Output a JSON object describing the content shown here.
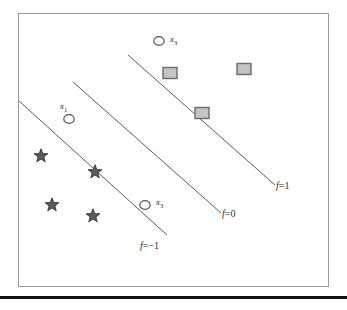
{
  "figure": {
    "kind": "scatter-with-decision-boundaries",
    "frame": {
      "x": 18,
      "y": 13,
      "width": 311,
      "height": 274,
      "border_color": "#9a9a9a"
    },
    "background": "#ffffff",
    "bottom_rule_color": "#111111"
  },
  "chart_data": {
    "type": "scatter",
    "title": "",
    "xlabel": "",
    "ylabel": "",
    "xlim": [
      0,
      347
    ],
    "ylim": [
      0,
      310
    ],
    "grid": false,
    "legend": "none",
    "axes_visible": false,
    "series": [
      {
        "name": "squares",
        "marker": "square",
        "fill_color": "#c4c4c4",
        "edge_color": "#6b6b6b",
        "points": [
          {
            "x": 170,
            "y": 73
          },
          {
            "x": 202,
            "y": 113
          },
          {
            "x": 244,
            "y": 69
          }
        ]
      },
      {
        "name": "circles",
        "marker": "circle-open",
        "fill_color": "#ffffff",
        "edge_color": "#555555",
        "points": [
          {
            "x": 159,
            "y": 41,
            "label": "x",
            "sub": "3"
          },
          {
            "x": 69,
            "y": 119,
            "label": "x",
            "sub": "1"
          },
          {
            "x": 145,
            "y": 205,
            "label": "x",
            "sub": "3"
          }
        ]
      },
      {
        "name": "stars",
        "marker": "star",
        "fill_color": "#5a5a60",
        "edge_color": "#3d3d44",
        "points": [
          {
            "x": 41,
            "y": 156
          },
          {
            "x": 95,
            "y": 172
          },
          {
            "x": 52,
            "y": 205
          },
          {
            "x": 93,
            "y": 216
          }
        ]
      }
    ],
    "lines": [
      {
        "name": "f=1",
        "label": "f=1",
        "f_symbol": "f",
        "equals_value": "=1",
        "color": "#5a5a5a",
        "x1": 128,
        "y1": 55,
        "x2": 275,
        "y2": 185,
        "label_x": 276,
        "label_y": 180
      },
      {
        "name": "f=0",
        "label": "f=0",
        "f_symbol": "f",
        "equals_value": "=0",
        "color": "#5a5a5a",
        "x1": 73,
        "y1": 82,
        "x2": 221,
        "y2": 213,
        "label_x": 222,
        "label_y": 208
      },
      {
        "name": "f=-1",
        "label": "f=−1",
        "f_symbol": "f",
        "equals_value": "=−1",
        "color": "#5a5a5a",
        "x1": 19,
        "y1": 101,
        "x2": 167,
        "y2": 235,
        "label_x": 140,
        "label_y": 240
      }
    ],
    "point_labels": [
      {
        "text": "x",
        "sub": "3",
        "x": 170,
        "y": 34
      },
      {
        "text": "x",
        "sub": "1",
        "x": 60,
        "y": 101
      },
      {
        "text": "x",
        "sub": "3",
        "x": 156,
        "y": 197
      }
    ]
  }
}
